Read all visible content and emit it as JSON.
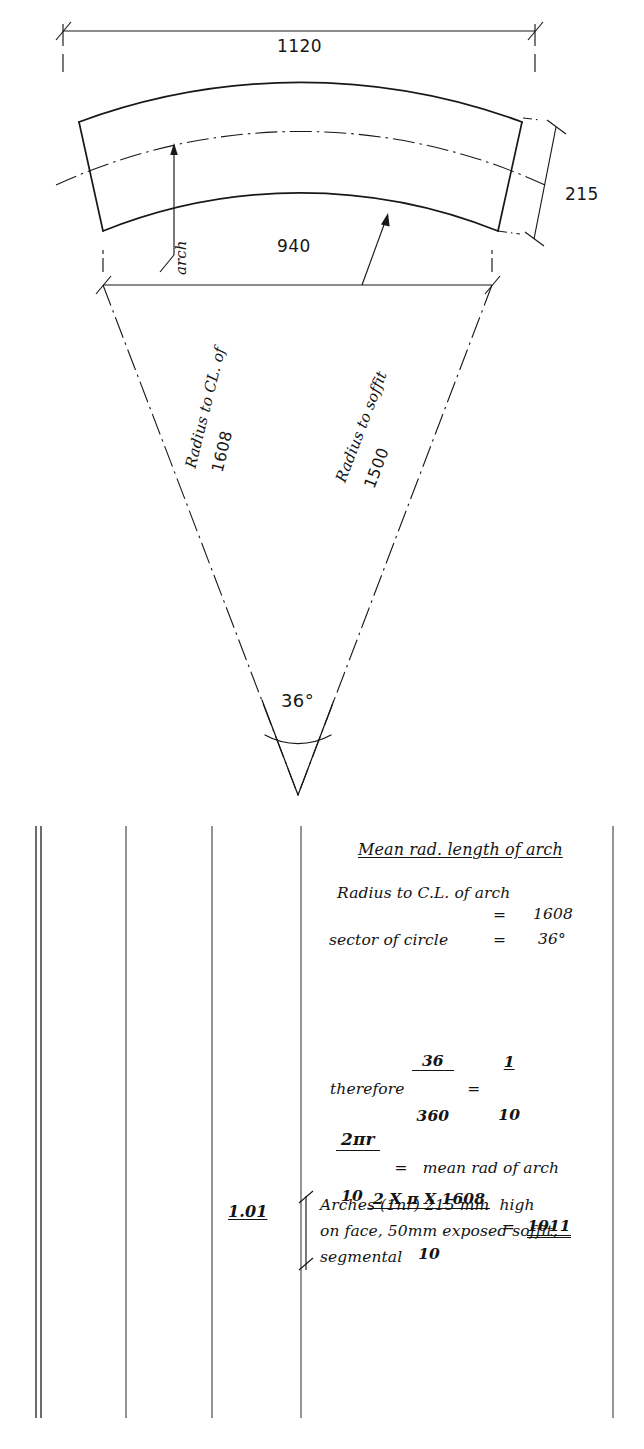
{
  "document": {
    "kind": "quantity-surveying dimension paper",
    "sheet_ref": "1.01"
  },
  "drawing": {
    "title": "segmental arch setting-out",
    "dimensions": {
      "overall_extrados_width": "1120",
      "span_chord": "940",
      "arch_height_on_face": "215",
      "included_angle": "36°"
    },
    "labels": {
      "arch_leader": "arch",
      "radius_centreline_text": "Radius to CL. of",
      "radius_centreline_value": "1608",
      "radius_soffit_text": "Radius to soffit",
      "radius_soffit_value": "1500"
    }
  },
  "takeoff": {
    "heading": "Mean rad. length of arch",
    "lines": [
      {
        "label": "Radius to C.L. of arch",
        "eq": "",
        "value": ""
      },
      {
        "label": "",
        "eq": "=",
        "value": "1608"
      },
      {
        "label": "sector of circle",
        "eq": "=",
        "value": "36°"
      }
    ],
    "therefore": {
      "word": "therefore",
      "left_num": "36",
      "left_den": "360",
      "eq": "=",
      "right_num": "1",
      "right_den": "10"
    },
    "formula": {
      "num": "2πr",
      "den": "10",
      "eq": "=",
      "text": "mean rad of arch"
    },
    "evaluation": {
      "num": "2 X π X 1608",
      "den": "10",
      "eq": "=",
      "result": "1011"
    },
    "description": [
      "Arches (1nr) 215 mm  high",
      "on face, 50mm exposed soffit,",
      "segmental"
    ],
    "quantity": "1.01"
  },
  "colors": {
    "ink": "#141414",
    "rule": "#4a4a4a",
    "paper": "#ffffff"
  }
}
